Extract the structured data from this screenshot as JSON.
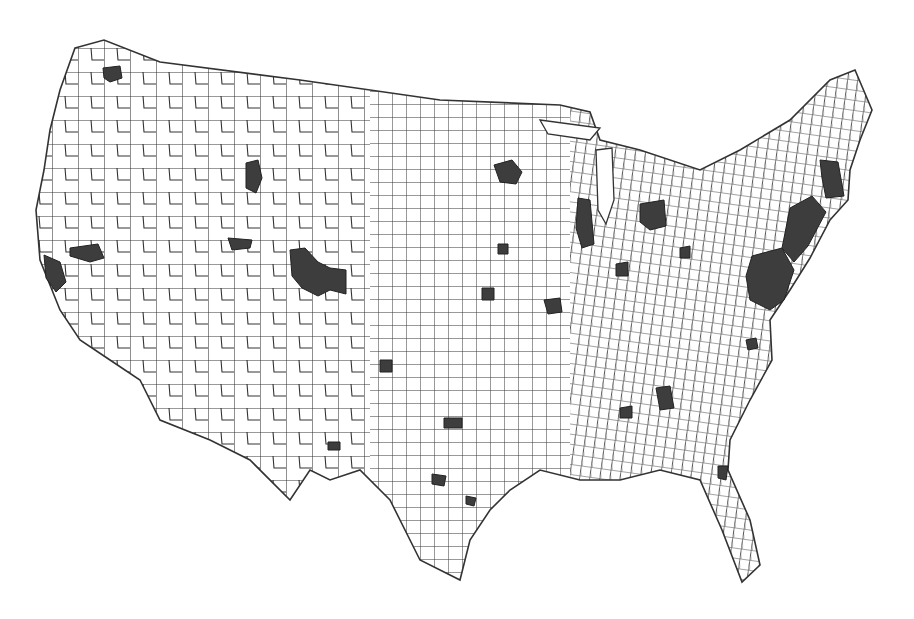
{
  "map": {
    "type": "choropleth",
    "subject": "United States counties (contiguous 48 states)",
    "legend": null,
    "title": null,
    "shade_colors": {
      "unshaded": "#ffffff",
      "shaded": "#3d3d3d",
      "border": "#333333"
    },
    "shaded_regions": [
      {
        "name": "seattle-area",
        "d": "M103,68 L120,66 L122,78 L110,82 L104,78 Z"
      },
      {
        "name": "sf-bay-area",
        "d": "M44,255 L60,262 L66,282 L56,292 L46,278 Z"
      },
      {
        "name": "sacramento-area",
        "d": "M70,248 L98,244 L104,258 L90,262 L70,256 Z"
      },
      {
        "name": "idaho-falls-area",
        "d": "M246,163 L258,160 L262,178 L256,193 L246,188 Z"
      },
      {
        "name": "salt-lake-area",
        "d": "M228,238 L252,240 L250,248 L232,250 Z"
      },
      {
        "name": "denver-front-range",
        "d": "M290,250 L305,248 L318,262 L330,268 L346,270 L346,294 L330,290 L318,296 L302,288 L292,276 Z"
      },
      {
        "name": "minneapolis-area",
        "d": "M494,165 L512,160 L522,172 L516,184 L500,182 Z"
      },
      {
        "name": "chicago-area",
        "d": "M578,198 L590,200 L594,244 L582,248 L576,228 Z"
      },
      {
        "name": "detroit-area",
        "d": "M640,204 L664,200 L666,226 L650,230 L640,222 Z"
      },
      {
        "name": "boston-area",
        "d": "M820,160 L838,162 L844,196 L826,198 L822,178 Z"
      },
      {
        "name": "ny-nj-corridor",
        "d": "M790,208 L812,196 L826,212 L808,246 L794,262 L782,248 Z"
      },
      {
        "name": "philly-dc-corridor",
        "d": "M752,256 L782,248 L794,270 L784,300 L770,310 L750,300 L746,276 Z"
      },
      {
        "name": "atlanta-area",
        "d": "M656,388 L670,386 L674,408 L660,410 Z"
      },
      {
        "name": "dallas-area",
        "d": "M444,418 L462,418 L462,428 L444,428 Z"
      },
      {
        "name": "austin-area",
        "d": "M432,474 L446,476 L444,486 L432,484 Z"
      },
      {
        "name": "houston-area",
        "d": "M466,496 L476,498 L474,506 L466,504 Z"
      },
      {
        "name": "st-louis-area",
        "d": "M544,300 L560,298 L562,312 L548,314 Z"
      },
      {
        "name": "kansas-city-area",
        "d": "M482,288 L494,288 L494,300 L482,300 Z"
      },
      {
        "name": "indianapolis-area",
        "d": "M616,264 L628,262 L628,276 L616,276 Z"
      },
      {
        "name": "columbus-area",
        "d": "M680,248 L690,246 L690,258 L680,258 Z"
      },
      {
        "name": "nashville-area",
        "d": "M620,408 L632,406 L632,418 L620,418 Z"
      },
      {
        "name": "raleigh-area",
        "d": "M746,340 L756,338 L758,348 L748,350 Z"
      },
      {
        "name": "jacksonville-area",
        "d": "M718,466 L728,466 L726,480 L718,478 Z"
      },
      {
        "name": "albuquerque-area",
        "d": "M328,442 L340,442 L340,450 L328,450 Z"
      },
      {
        "name": "wichita-area",
        "d": "M380,360 L392,360 L392,372 L380,372 Z"
      },
      {
        "name": "des-moines-area",
        "d": "M498,244 L508,244 L508,254 L498,254 Z"
      }
    ]
  }
}
